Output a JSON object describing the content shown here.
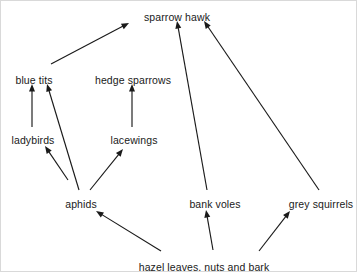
{
  "diagram": {
    "type": "food-web",
    "background_color": "#ffffff",
    "line_color": "#1a1a1a",
    "text_color": "#1a1a1a",
    "width": 357,
    "height": 272,
    "nodes": [
      {
        "id": "sparrow-hawk",
        "label": "sparrow hawk",
        "x": 176,
        "y": 11
      },
      {
        "id": "blue-tits",
        "label": "blue tits",
        "x": 33,
        "y": 74
      },
      {
        "id": "hedge-sparrows",
        "label": "hedge sparrows",
        "x": 132,
        "y": 74
      },
      {
        "id": "ladybirds",
        "label": "ladybirds",
        "x": 32,
        "y": 134
      },
      {
        "id": "lacewings",
        "label": "lacewings",
        "x": 133,
        "y": 134
      },
      {
        "id": "aphids",
        "label": "aphids",
        "x": 80,
        "y": 198
      },
      {
        "id": "bank-voles",
        "label": "bank voles",
        "x": 214,
        "y": 198
      },
      {
        "id": "grey-squirrels",
        "label": "grey squirrels",
        "x": 320,
        "y": 198
      },
      {
        "id": "hazel",
        "label": "hazel leaves, nuts and bark",
        "x": 203,
        "y": 261
      }
    ],
    "arrows": [
      {
        "id": "blue-tits-to-sparrow-hawk",
        "from": "blue tits",
        "to": "sparrow hawk",
        "x1": 50,
        "y1": 63,
        "x2": 128,
        "y2": 22
      },
      {
        "id": "bank-voles-to-sparrow-hawk",
        "from": "bank voles",
        "to": "sparrow hawk",
        "x1": 206,
        "y1": 189,
        "x2": 176,
        "y2": 20
      },
      {
        "id": "grey-squirrels-to-sparrow-hawk",
        "from": "grey squirrels",
        "to": "sparrow hawk",
        "x1": 318,
        "y1": 189,
        "x2": 203,
        "y2": 20
      },
      {
        "id": "ladybirds-to-blue-tits",
        "from": "ladybirds",
        "to": "blue tits",
        "x1": 31,
        "y1": 126,
        "x2": 31,
        "y2": 83
      },
      {
        "id": "aphids-to-blue-tits",
        "from": "aphids",
        "to": "blue tits",
        "x1": 78,
        "y1": 189,
        "x2": 46,
        "y2": 83
      },
      {
        "id": "lacewings-to-hedge-sparrows",
        "from": "lacewings",
        "to": "hedge sparrows",
        "x1": 131,
        "y1": 126,
        "x2": 131,
        "y2": 83
      },
      {
        "id": "aphids-to-ladybirds",
        "from": "aphids",
        "to": "ladybirds",
        "x1": 67,
        "y1": 179,
        "x2": 44,
        "y2": 145
      },
      {
        "id": "aphids-to-lacewings",
        "from": "aphids",
        "to": "lacewings",
        "x1": 89,
        "y1": 189,
        "x2": 122,
        "y2": 148
      },
      {
        "id": "hazel-to-aphids",
        "from": "hazel leaves, nuts and bark",
        "to": "aphids",
        "x1": 160,
        "y1": 250,
        "x2": 95,
        "y2": 210
      },
      {
        "id": "hazel-to-bank-voles",
        "from": "hazel leaves, nuts and bark",
        "to": "bank voles",
        "x1": 212,
        "y1": 249,
        "x2": 205,
        "y2": 209
      },
      {
        "id": "hazel-to-grey-squirrels",
        "from": "hazel leaves, nuts and bark",
        "to": "grey squirrels",
        "x1": 258,
        "y1": 250,
        "x2": 289,
        "y2": 210
      }
    ]
  }
}
